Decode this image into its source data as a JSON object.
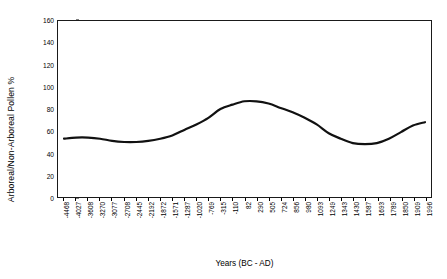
{
  "chart_data": {
    "type": "line",
    "title": "",
    "xlabel": "Years (BC - AD)",
    "ylabel": "Arboreal/Non-Arboreal Pollen %",
    "ylim": [
      0,
      160
    ],
    "y_ticks": [
      0,
      20,
      40,
      60,
      80,
      100,
      120,
      140,
      160
    ],
    "grid": false,
    "legend": false,
    "line_color": "#111111",
    "line_width": 2.2,
    "categories": [
      "-4468",
      "-4027",
      "-3608",
      "-3270",
      "-3077",
      "-2708",
      "-2445",
      "-2192",
      "-1872",
      "-1571",
      "-1287",
      "-1020",
      "-769",
      "-315",
      "-110",
      "82",
      "290",
      "505",
      "724",
      "856",
      "980",
      "1093",
      "1249",
      "1343",
      "1430",
      "1587",
      "1693",
      "1789",
      "1850",
      "1909",
      "1996"
    ],
    "values": [
      53,
      54,
      54,
      53,
      51,
      50,
      50,
      51,
      53,
      56,
      61,
      66,
      72,
      80,
      84,
      87,
      87,
      85,
      81,
      77,
      72,
      66,
      58,
      53,
      49,
      48,
      49,
      53,
      59,
      65,
      68
    ],
    "series": [
      {
        "name": "Arboreal/Non-Arboreal Pollen %",
        "values": [
          53,
          54,
          54,
          53,
          51,
          50,
          50,
          51,
          53,
          56,
          61,
          66,
          72,
          80,
          84,
          87,
          87,
          85,
          81,
          77,
          72,
          66,
          58,
          53,
          49,
          48,
          49,
          53,
          59,
          65,
          68
        ]
      }
    ],
    "annotations": []
  },
  "figure": {
    "background_color": "#ffffff",
    "frame_color": "#1a1a1a"
  }
}
